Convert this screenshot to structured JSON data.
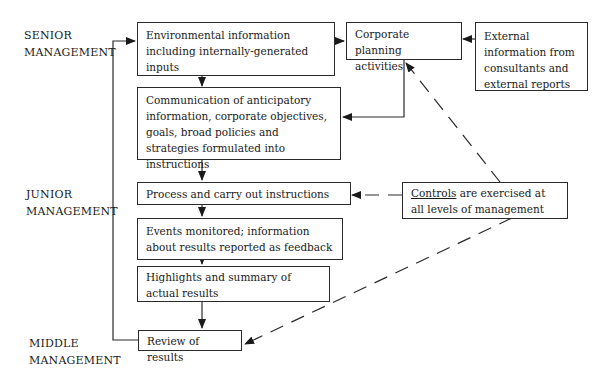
{
  "levels": {
    "senior": [
      "SENIOR",
      "MANAGEMENT"
    ],
    "junior": [
      "JUNIOR",
      "MANAGEMENT"
    ],
    "middle": [
      "MIDDLE",
      "MANAGEMENT"
    ]
  },
  "boxes": {
    "environmental": "Environmental information including internally-generated inputs",
    "communication": "Communication of anticipatory information, corporate objectives, goals, broad policies and strategies formulated into instructions",
    "process": "Process and carry out instructions",
    "events": "Events monitored; information about results reported as feedback",
    "highlights": "Highlights and summary of actual results",
    "review": "Review of results",
    "corporate_planning": "Corporate planning activities",
    "external": "External information from consultants and external reports",
    "controls_keyword": "Controls",
    "controls_rest": " are exercised at all levels of management"
  }
}
